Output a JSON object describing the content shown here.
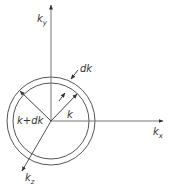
{
  "diagram": {
    "colors": {
      "stroke": "#555555",
      "text": "#333333",
      "background": "#ffffff"
    },
    "axes": {
      "ky": {
        "label": "k",
        "sub": "y"
      },
      "kx": {
        "label": "k",
        "sub": "x"
      },
      "kz": {
        "label": "k",
        "sub": "z"
      }
    },
    "labels": {
      "dk": "dk",
      "k": "k",
      "k_plus_dk": "k+dk"
    },
    "geometry": {
      "center": [
        51,
        121
      ],
      "inner_radius": 38,
      "outer_radius": 44
    }
  }
}
